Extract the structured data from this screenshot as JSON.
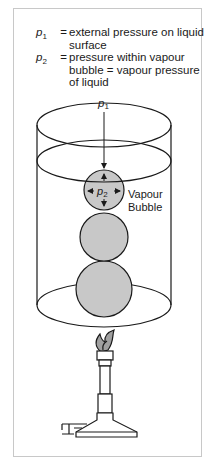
{
  "legend": [
    {
      "symbol": "p",
      "subscript": "1",
      "equals": "=",
      "description": "external pressure on liquid surface"
    },
    {
      "symbol": "p",
      "subscript": "2",
      "equals": "=",
      "description": "pressure within vapour bubble = vapour pressure of liquid"
    }
  ],
  "diagram": {
    "top_pressure_label": {
      "symbol": "p",
      "subscript": "1"
    },
    "bubble_pressure_label": {
      "symbol": "p",
      "subscript": "2"
    },
    "bubble_label_line1": "Vapour",
    "bubble_label_line2": "Bubble",
    "colors": {
      "bubble_fill": "#c8c8c8",
      "line": "#1a1a1a",
      "frame": "#c8c8c8",
      "flame_fill": "#a0a0a0"
    }
  }
}
